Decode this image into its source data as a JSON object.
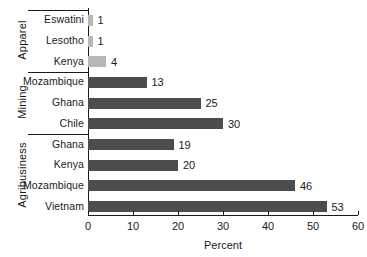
{
  "chart_data": {
    "type": "bar",
    "orientation": "horizontal",
    "title": "",
    "subtitle": "",
    "xlabel": "Percent",
    "ylabel": "",
    "xlim": [
      0,
      60
    ],
    "xticks": [
      0,
      10,
      20,
      30,
      40,
      50,
      60
    ],
    "xtick_labels": [
      "0",
      "10",
      "20",
      "30",
      "40",
      "50",
      "60"
    ],
    "grid": false,
    "legend": "none",
    "categories": [
      "Eswatini",
      "Lesotho",
      "Kenya",
      "Mozambique",
      "Ghana",
      "Chile",
      "Ghana",
      "Kenya",
      "Mozambique",
      "Vietnam"
    ],
    "values": [
      1,
      1,
      4,
      13,
      25,
      30,
      19,
      20,
      46,
      53
    ],
    "data_labels": [
      "1",
      "1",
      "4",
      "13",
      "25",
      "30",
      "19",
      "20",
      "46",
      "53"
    ],
    "groups": [
      {
        "label": "Apparel",
        "color": "#b8b8b8",
        "bars": [
          {
            "category": "Eswatini",
            "value": 1,
            "label": "1"
          },
          {
            "category": "Lesotho",
            "value": 1,
            "label": "1"
          },
          {
            "category": "Kenya",
            "value": 4,
            "label": "4"
          }
        ]
      },
      {
        "label": "Mining",
        "color": "#4d4d4d",
        "bars": [
          {
            "category": "Mozambique",
            "value": 13,
            "label": "13"
          },
          {
            "category": "Ghana",
            "value": 25,
            "label": "25"
          },
          {
            "category": "Chile",
            "value": 30,
            "label": "30"
          }
        ]
      },
      {
        "label": "Agribusiness",
        "color": "#4d4d4d",
        "bars": [
          {
            "category": "Ghana",
            "value": 19,
            "label": "19"
          },
          {
            "category": "Kenya",
            "value": 20,
            "label": "20"
          },
          {
            "category": "Mozambique",
            "value": 46,
            "label": "46"
          },
          {
            "category": "Vietnam",
            "value": 53,
            "label": "53"
          }
        ]
      }
    ],
    "colors": {
      "apparel_bar": "#b8b8b8",
      "mining_bar": "#4d4d4d",
      "agribusiness_bar": "#4d4d4d",
      "axis": "#1a1a1a",
      "text": "#1a1a1a",
      "background": "#ffffff"
    }
  }
}
